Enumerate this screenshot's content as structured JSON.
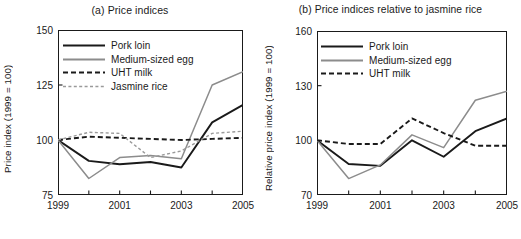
{
  "figure": {
    "panels": [
      "a",
      "b"
    ]
  },
  "colors": {
    "pork": "#1a1a1a",
    "egg": "#8c8c8c",
    "milk": "#1a1a1a",
    "rice": "#9a9a9a",
    "axis": "#1a1a1a",
    "background": "#ffffff"
  },
  "panel_a": {
    "title": "(a) Price indices",
    "ylabel": "Price index (1999 = 100)",
    "yticks": [
      "75",
      "100",
      "125",
      "150"
    ],
    "xticks": [
      "1999",
      "2001",
      "2003",
      "2005"
    ],
    "legend": [
      {
        "label": "Pork loin",
        "style": "solid-black"
      },
      {
        "label": "Medium-sized egg",
        "style": "solid-gray"
      },
      {
        "label": "UHT milk",
        "style": "dashed-black"
      },
      {
        "label": "Jasmine rice",
        "style": "dotted-gray"
      }
    ]
  },
  "panel_b": {
    "title": "(b) Price indices relative to jasmine rice",
    "ylabel": "Relative price index (1999 = 100)",
    "yticks": [
      "70",
      "100",
      "130",
      "160"
    ],
    "xticks": [
      "1999",
      "2001",
      "2003",
      "2005"
    ],
    "legend": [
      {
        "label": "Pork loin",
        "style": "solid-black"
      },
      {
        "label": "Medium-sized egg",
        "style": "solid-gray"
      },
      {
        "label": "UHT milk",
        "style": "dashed-black"
      }
    ]
  },
  "chart_data": [
    {
      "type": "line",
      "panel": "a",
      "title": "(a) Price indices",
      "xlabel": "",
      "ylabel": "Price index (1999 = 100)",
      "x": [
        1999,
        2000,
        2001,
        2002,
        2003,
        2004,
        2005
      ],
      "xlim": [
        1999,
        2005
      ],
      "ylim": [
        75,
        150
      ],
      "yticks": [
        75,
        100,
        125,
        150
      ],
      "xticks": [
        1999,
        2001,
        2003,
        2005
      ],
      "xminorticks": [
        2000,
        2002,
        2004
      ],
      "grid": false,
      "legend_position": "upper-left",
      "series": [
        {
          "name": "Pork loin",
          "values": [
            100,
            90.5,
            89,
            90,
            87.5,
            108,
            116
          ]
        },
        {
          "name": "Medium-sized egg",
          "values": [
            100,
            82.5,
            92,
            93,
            91.5,
            125,
            131
          ]
        },
        {
          "name": "UHT milk",
          "values": [
            100,
            101.5,
            101,
            100.5,
            100,
            100.5,
            101
          ]
        },
        {
          "name": "Jasmine rice",
          "values": [
            100,
            103.5,
            103,
            92,
            95,
            103,
            104
          ]
        }
      ]
    },
    {
      "type": "line",
      "panel": "b",
      "title": "(b) Price indices relative to jasmine rice",
      "xlabel": "",
      "ylabel": "Relative price index (1999 = 100)",
      "x": [
        1999,
        2000,
        2001,
        2002,
        2003,
        2004,
        2005
      ],
      "xlim": [
        1999,
        2005
      ],
      "ylim": [
        70,
        160
      ],
      "yticks": [
        70,
        100,
        130,
        160
      ],
      "xticks": [
        1999,
        2001,
        2003,
        2005
      ],
      "xminorticks": [
        2000,
        2002,
        2004
      ],
      "grid": false,
      "legend_position": "upper-left",
      "series": [
        {
          "name": "Pork loin",
          "values": [
            100,
            87,
            86,
            100,
            91,
            105,
            112
          ]
        },
        {
          "name": "Medium-sized egg",
          "values": [
            100,
            79,
            86.5,
            103,
            96,
            122,
            127
          ]
        },
        {
          "name": "UHT milk",
          "values": [
            100,
            98,
            98,
            112,
            104,
            97,
            97
          ]
        }
      ]
    }
  ]
}
